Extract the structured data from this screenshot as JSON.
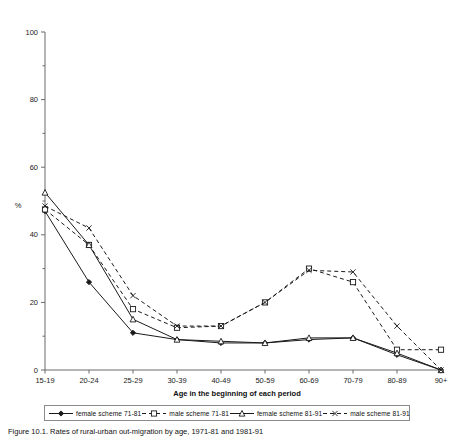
{
  "chart_data": {
    "type": "line",
    "title": "",
    "xlabel": "Age in the beginning of each period",
    "ylabel": "%",
    "categories": [
      "15-19",
      "20-24",
      "25-29",
      "30-39",
      "40-49",
      "50-59",
      "60-69",
      "70-79",
      "80-89",
      "90+"
    ],
    "ylim": [
      0,
      100
    ],
    "ytick_major": [
      0,
      20,
      40,
      60,
      80,
      100
    ],
    "ytick_minor": [
      10,
      30,
      50,
      70,
      90
    ],
    "grid": false,
    "legend_position": "bottom",
    "series": [
      {
        "name": "female scheme 71-81",
        "marker": "filled-diamond",
        "line": "solid",
        "values": [
          47,
          26,
          11,
          9,
          8,
          8,
          9,
          9.5,
          4.5,
          0
        ]
      },
      {
        "name": "male scheme 71-81",
        "marker": "hollow-square",
        "line": "dashed",
        "values": [
          47.5,
          37,
          18,
          12.5,
          13,
          20,
          30,
          26,
          6,
          6
        ]
      },
      {
        "name": "female scheme 81-91",
        "marker": "hollow-triangle",
        "line": "solid",
        "values": [
          52.5,
          37,
          15,
          9,
          8.5,
          8,
          9.5,
          9.5,
          5,
          0
        ]
      },
      {
        "name": "male scheme 81-91",
        "marker": "x-cross",
        "line": "dashed",
        "values": [
          48.5,
          42,
          22,
          13,
          13,
          20,
          29.5,
          29,
          13,
          0
        ]
      }
    ]
  },
  "axis": {
    "y_tick_labels": [
      "0",
      "20",
      "40",
      "60",
      "80",
      "100"
    ],
    "y_axis_label": "%",
    "x_axis_title": "Age in the beginning of each period",
    "x_tick_labels": [
      "15-19",
      "20-24",
      "25-29",
      "30-39",
      "40-49",
      "50-59",
      "60-69",
      "70-79",
      "80-89",
      "90+"
    ]
  },
  "legend": {
    "entries": [
      {
        "label": "female scheme 71-81",
        "marker": "filled-diamond",
        "line": "solid"
      },
      {
        "label": "male scheme 71-81",
        "marker": "hollow-square",
        "line": "dashed"
      },
      {
        "label": "female scheme 81-91",
        "marker": "hollow-triangle",
        "line": "solid"
      },
      {
        "label": "male scheme 81-91",
        "marker": "x-cross",
        "line": "dashed"
      }
    ]
  },
  "caption": {
    "text": "Figure 10.1. Rates of rural-urban out-migration by age, 1971-81 and 1981-91"
  }
}
